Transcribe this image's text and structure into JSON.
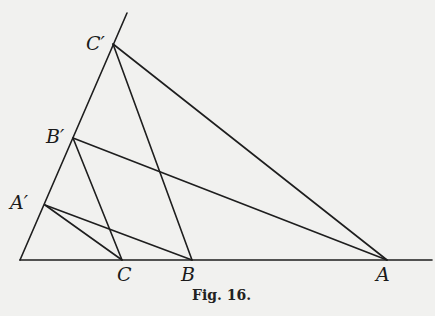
{
  "figure": {
    "caption": "Fig. 16.",
    "line_color": "#1e1e1e",
    "background": "#f1f1ef"
  },
  "points": {
    "O": {
      "label": "",
      "x": 20,
      "y": 260
    },
    "A": {
      "label": "A",
      "x": 387,
      "y": 260
    },
    "B": {
      "label": "B",
      "x": 192,
      "y": 260
    },
    "C": {
      "label": "C",
      "x": 122,
      "y": 260
    },
    "A1": {
      "label": "A′",
      "x": 45,
      "y": 205
    },
    "B1": {
      "label": "B′",
      "x": 73,
      "y": 138
    },
    "C1": {
      "label": "C′",
      "x": 113,
      "y": 44
    }
  },
  "segments": [
    {
      "name": "baseline",
      "from": [
        20,
        260
      ],
      "to": [
        432,
        260
      ]
    },
    {
      "name": "oblique-ray",
      "from": [
        20,
        260
      ],
      "to": [
        127,
        13
      ]
    },
    {
      "name": "C1-A",
      "from": [
        113,
        44
      ],
      "to": [
        387,
        260
      ]
    },
    {
      "name": "C1-B",
      "from": [
        113,
        44
      ],
      "to": [
        192,
        260
      ]
    },
    {
      "name": "B1-A",
      "from": [
        73,
        138
      ],
      "to": [
        387,
        260
      ]
    },
    {
      "name": "B1-C",
      "from": [
        73,
        138
      ],
      "to": [
        122,
        260
      ]
    },
    {
      "name": "A1-B",
      "from": [
        45,
        205
      ],
      "to": [
        192,
        260
      ]
    },
    {
      "name": "A1-C",
      "from": [
        45,
        205
      ],
      "to": [
        122,
        260
      ]
    }
  ]
}
